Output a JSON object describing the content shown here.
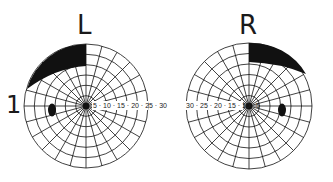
{
  "figure_number": "1",
  "left_field": {
    "label": "L",
    "center": [
      86,
      106
    ],
    "radius": 62,
    "scale_labels": [
      "5",
      "10",
      "15",
      "20",
      "25",
      "30"
    ],
    "scale_text": "5 · 10 · 15 · 20 · 25 · 30",
    "defect": "upper temporal (superior-left) quadrant defect",
    "blind_spot": "temporal blind spot left of center"
  },
  "right_field": {
    "label": "R",
    "center": [
      249,
      106
    ],
    "radius": 63,
    "scale_labels": [
      "30",
      "25",
      "20",
      "15",
      "10",
      "5"
    ],
    "scale_text": "30 · 25 · 20 · 15 · 10 · 5",
    "defect": "upper temporal (superior-right) quadrant defect",
    "blind_spot": "temporal blind spot right of center"
  },
  "colors": {
    "ink": "#111111",
    "paper": "#ffffff"
  }
}
